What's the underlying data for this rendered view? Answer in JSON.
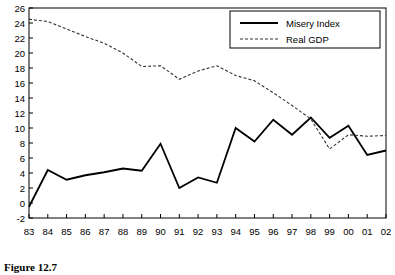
{
  "figure": {
    "caption": "Figure 12.7"
  },
  "legend": {
    "position": "top-right",
    "entries": [
      {
        "label": "Misery Index",
        "style": "solid",
        "color": "#000000"
      },
      {
        "label": "Real GDP",
        "style": "dashed",
        "color": "#333333"
      }
    ]
  },
  "chart_data": {
    "type": "line",
    "title": "",
    "subtitle": "",
    "xlabel": "",
    "ylabel": "",
    "grid": false,
    "legend_position": "top-right",
    "categories": [
      "83",
      "84",
      "85",
      "86",
      "87",
      "88",
      "89",
      "90",
      "91",
      "92",
      "93",
      "94",
      "95",
      "96",
      "97",
      "98",
      "99",
      "00",
      "01",
      "02"
    ],
    "x": [
      "83",
      "84",
      "85",
      "86",
      "87",
      "88",
      "89",
      "90",
      "91",
      "92",
      "93",
      "94",
      "95",
      "96",
      "97",
      "98",
      "99",
      "00",
      "01",
      "02"
    ],
    "xlim": [
      "83",
      "02"
    ],
    "ylim": [
      -2,
      26
    ],
    "ytick_labels": [
      "-2",
      "0",
      "2",
      "4",
      "6",
      "8",
      "10",
      "12",
      "14",
      "16",
      "18",
      "20",
      "22",
      "24",
      "26"
    ],
    "ytick_values": [
      -2,
      0,
      2,
      4,
      6,
      8,
      10,
      12,
      14,
      16,
      18,
      20,
      22,
      24,
      26
    ],
    "xtick_labels": [
      "83",
      "84",
      "85",
      "86",
      "87",
      "88",
      "89",
      "90",
      "91",
      "92",
      "93",
      "94",
      "95",
      "96",
      "97",
      "98",
      "99",
      "00",
      "01",
      "02"
    ],
    "series": [
      {
        "name": "Misery Index",
        "style": "solid",
        "color": "#000000",
        "values": [
          -0.5,
          4.4,
          3.1,
          3.7,
          4.1,
          4.6,
          4.3,
          7.9,
          2.0,
          3.4,
          2.7,
          10.0,
          8.2,
          11.1,
          9.1,
          11.4,
          8.7,
          10.3,
          6.4,
          7.0
        ]
      },
      {
        "name": "Real GDP",
        "style": "dashed",
        "color": "#333333",
        "values": [
          24.5,
          24.2,
          23.2,
          22.2,
          21.3,
          20.0,
          18.2,
          18.3,
          16.5,
          17.6,
          18.3,
          17.0,
          16.3,
          14.7,
          13.0,
          11.2,
          7.2,
          9.1,
          8.9,
          9.0
        ]
      }
    ]
  }
}
